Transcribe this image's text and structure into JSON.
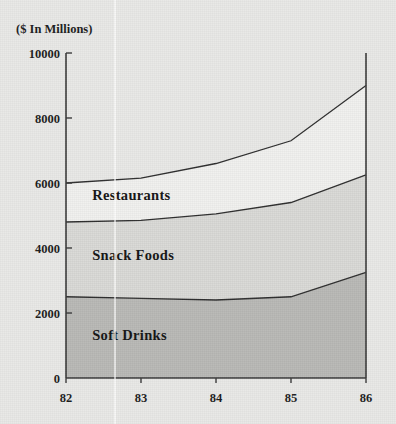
{
  "chart_data": {
    "type": "area",
    "stacked": true,
    "title": "($ In Millions)",
    "xlabel": "",
    "ylabel": "",
    "x": [
      82,
      83,
      84,
      85,
      86
    ],
    "categories": [
      "82",
      "83",
      "84",
      "85",
      "86"
    ],
    "xtick_labels": [
      "82",
      "83",
      "84",
      "85",
      "86"
    ],
    "ytick_labels": [
      "0",
      "2000",
      "4000",
      "6000",
      "8000",
      "10000"
    ],
    "ytick_values": [
      0,
      2000,
      4000,
      6000,
      8000,
      10000
    ],
    "ylim": [
      0,
      10000
    ],
    "xlim": [
      82,
      86
    ],
    "grid": false,
    "legend": "inline-labels",
    "series": [
      {
        "name": "Soft Drinks",
        "values": [
          2500,
          2450,
          2400,
          2500,
          3250
        ],
        "cumulative": [
          2500,
          2450,
          2400,
          2500,
          3250
        ],
        "color": "#b9b9b6",
        "label_x": 82.35,
        "label_y": 1180
      },
      {
        "name": "Snack Foods",
        "values": [
          2300,
          2400,
          2650,
          2900,
          3000
        ],
        "cumulative": [
          4800,
          4850,
          5050,
          5400,
          6250
        ],
        "color": "#d9d9d6",
        "label_x": 82.35,
        "label_y": 3620
      },
      {
        "name": "Restaurants",
        "values": [
          1200,
          1300,
          1550,
          1900,
          2750
        ],
        "cumulative": [
          6000,
          6150,
          6600,
          7300,
          9000
        ],
        "color": "#f1f1ef",
        "label_x": 82.35,
        "label_y": 5480
      }
    ],
    "colors": {
      "background": "#e9e9e7",
      "axis": "#3a3a3a",
      "text": "#1d1d1d",
      "soft_drinks": "#b9b9b6",
      "snack_foods": "#d9d9d6",
      "restaurants": "#f1f1ef"
    }
  }
}
